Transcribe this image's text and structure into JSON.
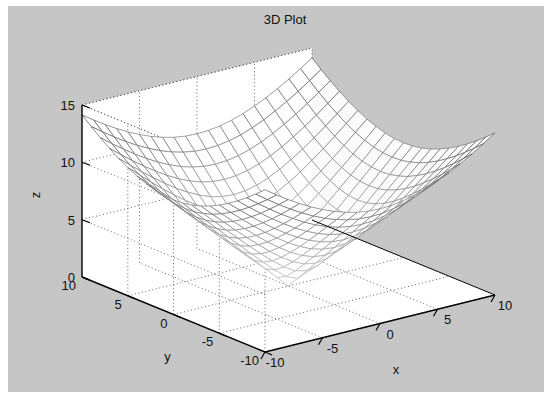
{
  "figure": {
    "background_color": "#c6c6c6",
    "axes_background_color": "#ffffff",
    "page_background_color": "#ffffff",
    "axis_line_color": "#000000",
    "grid_color": "#555555",
    "mesh_color": "#8a8a8a"
  },
  "chart_data": {
    "type": "surface",
    "title": "3D Plot",
    "xlabel": "x",
    "ylabel": "y",
    "zlabel": "z",
    "xlim": [
      -10,
      10
    ],
    "ylim": [
      -10,
      10
    ],
    "zlim": [
      0,
      15
    ],
    "xticks": [
      -10,
      -5,
      0,
      5,
      10
    ],
    "yticks": [
      10,
      5,
      0,
      -5,
      -10
    ],
    "zticks": [
      0,
      5,
      10,
      15
    ],
    "xtick_labels": [
      "-10",
      "-5",
      "0",
      "5",
      "10"
    ],
    "ytick_labels": [
      "10",
      "5",
      "0",
      "-5",
      "-10"
    ],
    "ztick_labels": [
      "0",
      "5",
      "10",
      "15"
    ],
    "grid": true,
    "legend": false,
    "mesh_n": 21,
    "function": "z = sqrt(x^2 + y^2)",
    "z_min": 0,
    "z_max": 14.14,
    "view_azimuth": -37.5,
    "view_elevation": 30,
    "surface_corner_values": [
      14.14,
      14.14,
      14.14,
      14.14
    ],
    "sample_points": [
      {
        "x": -10,
        "y": -10,
        "z": 14.14
      },
      {
        "x": -10,
        "y": 0,
        "z": 10.0
      },
      {
        "x": -10,
        "y": 10,
        "z": 14.14
      },
      {
        "x": 0,
        "y": -10,
        "z": 10.0
      },
      {
        "x": 0,
        "y": 0,
        "z": 0.0
      },
      {
        "x": 0,
        "y": 10,
        "z": 10.0
      },
      {
        "x": 10,
        "y": -10,
        "z": 14.14
      },
      {
        "x": 10,
        "y": 0,
        "z": 10.0
      },
      {
        "x": 10,
        "y": 10,
        "z": 14.14
      }
    ]
  }
}
